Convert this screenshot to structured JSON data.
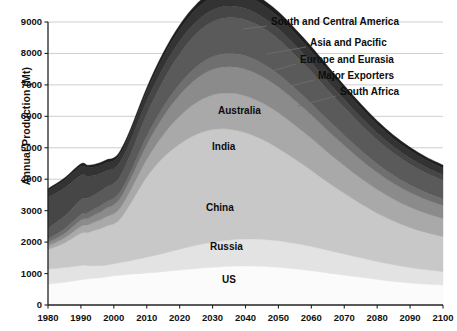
{
  "chart_data": {
    "type": "area",
    "stacked": true,
    "title": "",
    "xlabel": "",
    "ylabel": "Annual Production (Mt)",
    "xlim": [
      1980,
      2100
    ],
    "ylim": [
      0,
      9000
    ],
    "grid": true,
    "xticks": [
      "1980",
      "1990",
      "2000",
      "2010",
      "2020",
      "2030",
      "2040",
      "2050",
      "2060",
      "2070",
      "2080",
      "2090",
      "2100"
    ],
    "yticks": [
      "0",
      "1000",
      "2000",
      "3000",
      "4000",
      "5000",
      "6000",
      "7000",
      "8000",
      "9000"
    ],
    "legend_position": "inline-and-callout",
    "x": [
      1980,
      1985,
      1990,
      1992,
      1994,
      1996,
      1998,
      2000,
      2002,
      2005,
      2010,
      2015,
      2020,
      2025,
      2030,
      2035,
      2040,
      2045,
      2050,
      2055,
      2060,
      2065,
      2070,
      2075,
      2080,
      2085,
      2090,
      2095,
      2100
    ],
    "series": [
      {
        "name": "US",
        "label_style": "inline",
        "color": "#fbfbfb",
        "values": [
          660,
          720,
          800,
          830,
          850,
          870,
          900,
          930,
          950,
          980,
          1020,
          1060,
          1110,
          1160,
          1200,
          1230,
          1240,
          1230,
          1200,
          1150,
          1090,
          1020,
          950,
          880,
          810,
          750,
          700,
          660,
          630
        ]
      },
      {
        "name": "Russia",
        "label_style": "inline",
        "color": "#e3e3e3",
        "values": [
          480,
          470,
          460,
          420,
          400,
          380,
          370,
          380,
          400,
          430,
          500,
          580,
          660,
          740,
          800,
          840,
          860,
          860,
          840,
          810,
          770,
          720,
          670,
          620,
          570,
          530,
          490,
          460,
          430
        ]
      },
      {
        "name": "China",
        "label_style": "inline",
        "color": "#c8c8c8",
        "values": [
          620,
          780,
          1020,
          1050,
          1120,
          1180,
          1250,
          1270,
          1390,
          1800,
          2550,
          3050,
          3350,
          3520,
          3580,
          3520,
          3380,
          3180,
          2940,
          2680,
          2420,
          2160,
          1930,
          1720,
          1540,
          1390,
          1270,
          1180,
          1110
        ]
      },
      {
        "name": "India",
        "label_style": "inline",
        "color": "#a9a9a9",
        "values": [
          120,
          160,
          220,
          240,
          260,
          280,
          300,
          320,
          350,
          420,
          560,
          720,
          880,
          1010,
          1100,
          1150,
          1170,
          1160,
          1130,
          1080,
          1020,
          950,
          880,
          810,
          750,
          690,
          650,
          610,
          580
        ]
      },
      {
        "name": "Australia",
        "label_style": "inline",
        "color": "#8b8b8b",
        "values": [
          100,
          140,
          200,
          210,
          230,
          250,
          270,
          290,
          310,
          360,
          470,
          580,
          680,
          760,
          810,
          840,
          850,
          840,
          820,
          780,
          740,
          690,
          640,
          590,
          540,
          500,
          465,
          435,
          410
        ]
      },
      {
        "name": "South Africa",
        "label_style": "callout",
        "color": "#6f6f6f",
        "values": [
          120,
          150,
          180,
          185,
          190,
          195,
          200,
          205,
          210,
          225,
          265,
          305,
          345,
          380,
          405,
          420,
          425,
          420,
          410,
          392,
          372,
          348,
          324,
          300,
          278,
          258,
          240,
          226,
          214
        ]
      },
      {
        "name": "Major Exporters",
        "label_style": "callout",
        "color": "#5a5a5a",
        "values": [
          340,
          400,
          470,
          460,
          450,
          470,
          480,
          470,
          500,
          560,
          700,
          840,
          960,
          1050,
          1110,
          1140,
          1150,
          1140,
          1110,
          1065,
          1010,
          950,
          885,
          820,
          760,
          705,
          660,
          620,
          590
        ]
      },
      {
        "name": "Europe and Eurasia",
        "label_style": "callout",
        "color": "#464646",
        "values": [
          980,
          900,
          780,
          700,
          620,
          560,
          510,
          470,
          450,
          430,
          420,
          410,
          400,
          390,
          380,
          368,
          355,
          340,
          325,
          308,
          290,
          272,
          254,
          236,
          220,
          206,
          194,
          184,
          176
        ]
      },
      {
        "name": "Asia and Pacific",
        "label_style": "callout",
        "color": "#333333",
        "values": [
          220,
          250,
          280,
          270,
          265,
          260,
          258,
          255,
          262,
          275,
          310,
          345,
          375,
          395,
          405,
          408,
          405,
          398,
          388,
          374,
          358,
          340,
          320,
          300,
          280,
          262,
          246,
          232,
          220
        ]
      },
      {
        "name": "South and Central America",
        "label_style": "callout",
        "color": "#1f1f1f",
        "values": [
          60,
          70,
          80,
          82,
          84,
          86,
          88,
          90,
          94,
          100,
          115,
          130,
          145,
          155,
          162,
          165,
          166,
          164,
          160,
          154,
          147,
          139,
          130,
          122,
          113,
          106,
          99,
          94,
          89
        ]
      }
    ],
    "callouts": [
      {
        "name": "South and Central America",
        "label_xy": [
          271,
          22
        ],
        "anchor_xy": [
          243,
          29
        ]
      },
      {
        "name": "Asia and Pacific",
        "label_xy": [
          310,
          43
        ],
        "anchor_xy": [
          267,
          54
        ]
      },
      {
        "name": "Europe and Eurasia",
        "label_xy": [
          300,
          60
        ],
        "anchor_xy": [
          272,
          71
        ]
      },
      {
        "name": "Major Exporters",
        "label_xy": [
          318,
          76
        ],
        "anchor_xy": [
          283,
          88
        ]
      },
      {
        "name": "South Africa",
        "label_xy": [
          340,
          92
        ],
        "anchor_xy": [
          298,
          106
        ]
      }
    ],
    "inline_labels": [
      {
        "name": "Australia",
        "xy": [
          218,
          105
        ]
      },
      {
        "name": "India",
        "xy": [
          212,
          141
        ]
      },
      {
        "name": "China",
        "xy": [
          206,
          202
        ]
      },
      {
        "name": "Russia",
        "xy": [
          210,
          241
        ]
      },
      {
        "name": "US",
        "xy": [
          222,
          274
        ]
      }
    ]
  },
  "axes": {
    "ylabel": "Annual Production (Mt)"
  }
}
